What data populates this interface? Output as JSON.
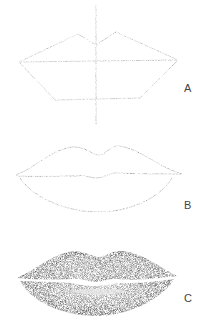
{
  "figures": [
    {
      "id": "A",
      "label": "A",
      "stage": "construction-lines"
    },
    {
      "id": "B",
      "label": "B",
      "stage": "contour-outline"
    },
    {
      "id": "C",
      "label": "C",
      "stage": "shaded-rendering"
    }
  ],
  "colors": {
    "background": "#ffffff",
    "pencil_light": "#9a9a9a",
    "pencil_dark": "#3a3a3a",
    "label": "#444444"
  }
}
